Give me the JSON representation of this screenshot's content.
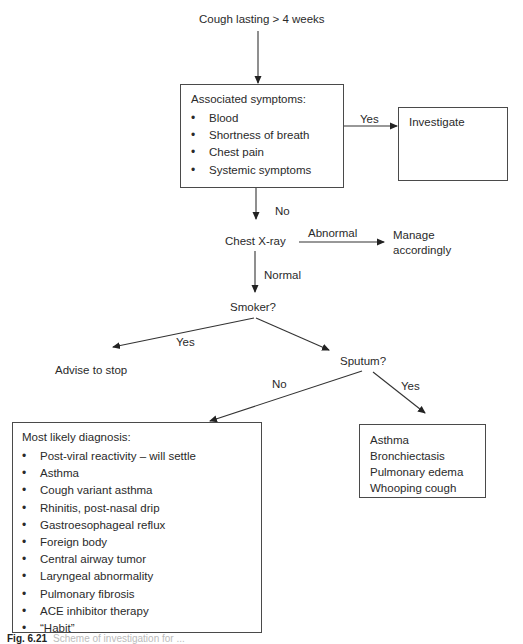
{
  "diagram": {
    "type": "flowchart",
    "title_node": "Cough lasting > 4 weeks",
    "associated_box": {
      "heading": "Associated symptoms:",
      "items": [
        "Blood",
        "Shortness of breath",
        "Chest pain",
        "Systemic symptoms"
      ]
    },
    "investigate_box": {
      "label": "Investigate"
    },
    "edges": {
      "yes_to_investigate": "Yes",
      "no_to_xray": "No",
      "xray_abnormal": "Abnormal",
      "xray_normal": "Normal",
      "smoker_yes": "Yes",
      "sputum_no": "No",
      "sputum_yes": "Yes"
    },
    "nodes": {
      "chest_xray": "Chest X-ray",
      "manage_line1": "Manage",
      "manage_line2": "accordingly",
      "smoker": "Smoker?",
      "advise": "Advise to stop",
      "sputum": "Sputum?"
    },
    "diagnosis_box": {
      "heading": "Most likely diagnosis:",
      "items": [
        "Post-viral reactivity – will settle",
        "Asthma",
        "Cough variant asthma",
        "Rhinitis, post-nasal drip",
        "Gastroesophageal reflux",
        "Foreign body",
        "Central airway tumor",
        "Laryngeal abnormality",
        "Pulmonary fibrosis",
        "ACE inhibitor therapy",
        "“Habit”"
      ]
    },
    "sputum_yes_box": {
      "items": [
        "Asthma",
        "Bronchiectasis",
        "Pulmonary edema",
        "Whooping cough"
      ]
    },
    "caption": {
      "label": "Fig. 6.21",
      "text": "Scheme of investigation for ..."
    }
  }
}
